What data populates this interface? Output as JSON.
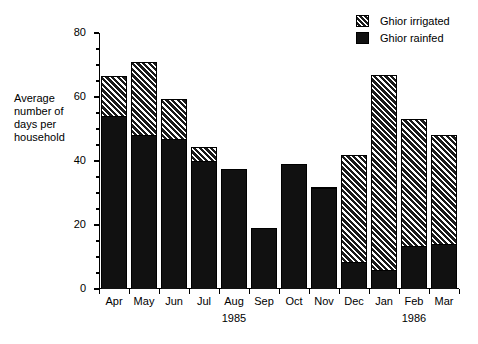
{
  "chart_data": {
    "type": "bar",
    "subtype": "stacked",
    "title": "",
    "xlabel": "",
    "ylabel": "Average number of days per household",
    "ylim": [
      0,
      80
    ],
    "yticks": [
      0,
      20,
      40,
      60,
      80
    ],
    "ytick_labels": [
      "0",
      "20",
      "40",
      "60",
      "80"
    ],
    "y_minor_tick_step": 5,
    "grid": false,
    "legend_position": "top-right",
    "categories": [
      "Apr",
      "May",
      "Jun",
      "Jul",
      "Aug",
      "Sep",
      "Oct",
      "Nov",
      "Dec",
      "Jan",
      "Feb",
      "Mar"
    ],
    "category_year_annotations": [
      {
        "index": 4,
        "label": "1985"
      },
      {
        "index": 10,
        "label": "1986"
      }
    ],
    "series": [
      {
        "name": "Ghior rainfed",
        "fill": "solid-black",
        "values": [
          54,
          48,
          47,
          40,
          37.5,
          19,
          39,
          31.5,
          8.5,
          6,
          13.5,
          14
        ]
      },
      {
        "name": "Ghior irrigated",
        "fill": "hatched",
        "values": [
          12.5,
          23,
          12.5,
          4.5,
          0,
          0,
          0,
          0.5,
          33.5,
          61,
          39.5,
          34
        ]
      }
    ],
    "totals": [
      66.5,
      71,
      59.5,
      44.5,
      37.5,
      19,
      39,
      32,
      42,
      67,
      53,
      48
    ]
  },
  "legend": {
    "items": [
      {
        "label": "Ghior irrigated",
        "fill": "hatched"
      },
      {
        "label": "Ghior rainfed",
        "fill": "solid"
      }
    ]
  },
  "axis": {
    "y_title_lines": [
      "Average",
      "number of",
      "days per",
      "household"
    ]
  },
  "colors": {
    "bar_rainfed": "#111111",
    "bar_irrigated_base": "#1a1a1a",
    "bar_irrigated_hatch": "#ffffff",
    "axis": "#000000",
    "background": "#ffffff",
    "text": "#000000"
  }
}
